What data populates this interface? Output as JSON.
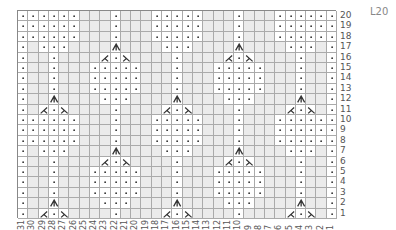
{
  "chart_id": "L20",
  "columns": 31,
  "rows": 20,
  "column_labels": [
    "31",
    "30",
    "29",
    "28",
    "27",
    "26",
    "25",
    "24",
    "23",
    "22",
    "21",
    "20",
    "19",
    "18",
    "17",
    "16",
    "15",
    "14",
    "13",
    "12",
    "11",
    "10",
    "9",
    "8",
    "7",
    "6",
    "5",
    "4",
    "3",
    "2",
    "1"
  ],
  "row_labels": [
    "20",
    "19",
    "18",
    "17",
    "16",
    "15",
    "14",
    "13",
    "12",
    "11",
    "10",
    "9",
    "8",
    "7",
    "6",
    "5",
    "4",
    "3",
    "2",
    "1"
  ],
  "legend_symbols": {
    ".": "dot-stitch",
    "-": "blank",
    "A": "double-decrease",
    "L": "left-decrease",
    "R": "right-decrease"
  },
  "grid_rows_top_to_bottom": [
    "......---.---.....---.---......",
    "......---.---.....---.---......",
    "......---.---.....---.---......",
    ".-...----A----...----A----...-.",
    ".--.----L.R----.----L.R----.--.",
    ".--.---.....---.---.....---.--.",
    ".--.---.....---.---.....---.--.",
    ".--.---.....---.---.....---.--.",
    ".--A----...----A----...----A--.",
    ".-L.R----.----L.R----.----L.R-.",
    "......---.---.....---.---......",
    "......---.---.....---.---......",
    "......---.---.....---.---......",
    ".-...----A----...----A----...-.",
    ".--.----L.R----.----L.R----.--.",
    ".--.---.....---.---.....---.--.",
    ".--.---.....---.---.....---.--.",
    ".--.---.....---.---.....---.--.",
    ".--A----...----A----...----A--.",
    ".-L.R----.----L.R----.----L.R-."
  ],
  "colors": {
    "blank_cell": "#ebebeb",
    "stitch_cell": "#ffffff",
    "grid_line": "#aaaaaa",
    "symbol": "#333333",
    "label": "#555555"
  }
}
